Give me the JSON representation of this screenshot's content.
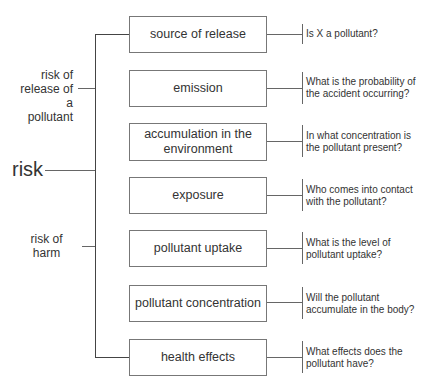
{
  "root": {
    "label": "risk"
  },
  "groups": [
    {
      "label": "risk of release of a pollutant"
    },
    {
      "label": "risk of harm"
    }
  ],
  "steps": [
    {
      "label": "source of release",
      "question": "Is X a pollutant?"
    },
    {
      "label": "emission",
      "question": "What is the probability of the accident occurring?"
    },
    {
      "label": "accumulation in the environment",
      "question": "In what concentration is the pollutant present?"
    },
    {
      "label": "exposure",
      "question": "Who comes into contact with the pollutant?"
    },
    {
      "label": "pollutant uptake",
      "question": "What is the level of pollutant uptake?"
    },
    {
      "label": "pollutant concentration",
      "question": "Will the pollutant accumulate in the body?"
    },
    {
      "label": "health effects",
      "question": "What effects does the pollutant have?"
    }
  ]
}
